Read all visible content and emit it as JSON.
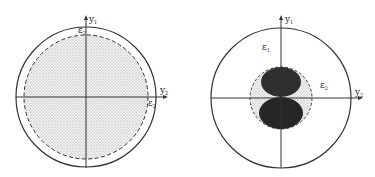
{
  "figures": [
    {
      "id": "left",
      "axes": {
        "vertical_label": "y",
        "vertical_sub": "1",
        "horizontal_label": "y",
        "horizontal_sub": "2"
      },
      "regions": [
        {
          "label": "ε",
          "sub": "2",
          "position": "top-inside"
        },
        {
          "label": "ε",
          "sub": "2",
          "position": "right-inside"
        }
      ],
      "description": "Outer solid circle with dashed inner circle; interior stippled/shaded"
    },
    {
      "id": "right",
      "axes": {
        "vertical_label": "y",
        "vertical_sub": "1",
        "horizontal_label": "y",
        "horizontal_sub": "2"
      },
      "regions": [
        {
          "label": "ε",
          "sub": "1",
          "position": "upper-left"
        },
        {
          "label": "ε",
          "sub": "2",
          "position": "right"
        }
      ],
      "description": "Outer solid circle; small dashed stippled circle at center containing two dark lobes (figure-eight) along the vertical axis"
    }
  ],
  "colors": {
    "line": "#333333",
    "stipple": "#d9d9d9",
    "lobe": "#2b2b2b",
    "background": "#ffffff"
  }
}
